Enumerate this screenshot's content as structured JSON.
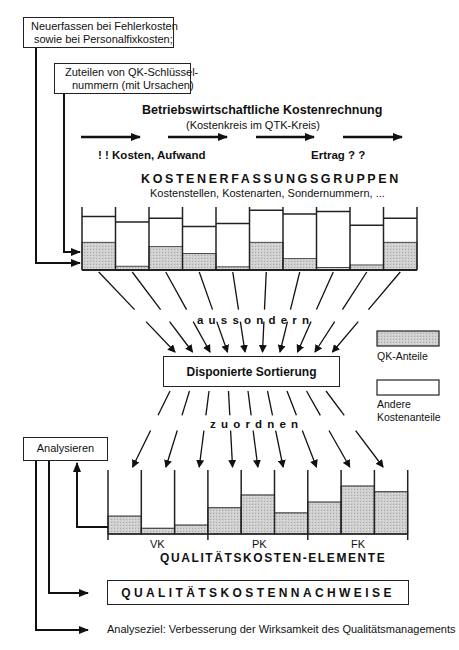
{
  "top_boxes": {
    "neuerfassen_line1": "Neuerfassen bei Fehlerkosten",
    "neuerfassen_line2": "sowie bei Personalfixkosten;",
    "zuteilen_line1": "Zuteilen von QK-Schlüssel-",
    "zuteilen_line2": "nummern (mit Ursachen)"
  },
  "header": {
    "title": "Betriebswirtschaftliche Kostenrechnung",
    "subtitle": "(Kostenkreis im QTK-Kreis)",
    "left_label": "! !  Kosten, Aufwand",
    "right_label": "Ertrag ? ?"
  },
  "groups": {
    "title": "KOSTENERFASSUNGSGRUPPEN",
    "subtitle": "Kostenstellen, Kostenarten, Sondernummern, ..."
  },
  "top_bins": [
    {
      "total": 0.85,
      "qk": 0.44
    },
    {
      "total": 0.76,
      "qk": 0.06
    },
    {
      "total": 0.82,
      "qk": 0.37
    },
    {
      "total": 0.69,
      "qk": 0.26
    },
    {
      "total": 0.74,
      "qk": 0.05
    },
    {
      "total": 0.95,
      "qk": 0.44
    },
    {
      "total": 0.89,
      "qk": 0.18
    },
    {
      "total": 0.93,
      "qk": 0.04
    },
    {
      "total": 0.71,
      "qk": 0.08
    },
    {
      "total": 0.82,
      "qk": 0.44
    }
  ],
  "aussondern_label": "a u s s o n d e r n",
  "sorting_box": "Disponierte Sortierung",
  "zuordnen_label": "z u o r d n e n",
  "legend": {
    "qk_label": "QK-Anteile",
    "other_line1": "Andere",
    "other_line2": "Kostenanteile",
    "qk_color": "#c8c8c8",
    "other_color": "#ffffff"
  },
  "analysieren_box": "Analysieren",
  "bottom_bins": [
    {
      "qk": 0.28
    },
    {
      "qk": 0.09
    },
    {
      "qk": 0.14
    },
    {
      "qk": 0.41
    },
    {
      "qk": 0.61
    },
    {
      "qk": 0.33
    },
    {
      "qk": 0.5
    },
    {
      "qk": 0.75
    },
    {
      "qk": 0.66
    }
  ],
  "groups_bottom": [
    "VK",
    "PK",
    "FK"
  ],
  "elements_title": "QUALITÄTSKOSTEN-ELEMENTE",
  "nachweise_box": "QUALITÄTSKOSTENNACHWEISE",
  "analyseziel": "Analyseziel: Verbesserung der Wirksamkeit des Qualitätsmanagements"
}
